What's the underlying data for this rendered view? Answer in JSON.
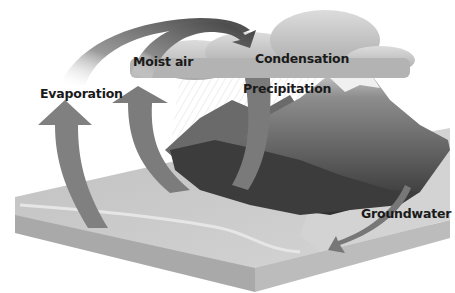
{
  "diagram": {
    "style": "grayscale",
    "colors": {
      "arrow": "#7f7f7f",
      "arrow_dark": "#4e4e4e",
      "cloud": "#bdbdbd",
      "mountain_dark": "#3a3a3a",
      "ground": "#c9c9c9",
      "block_side": "#a8a8a8",
      "text": "#1a1a1a"
    },
    "labels": {
      "evaporation": "Evaporation",
      "moist_air": "Moist air",
      "condensation": "Condensation",
      "precipitation": "Precipitation",
      "groundwater": "Groundwater"
    },
    "elements": [
      {
        "name": "evaporation-arrow",
        "direction": "up"
      },
      {
        "name": "moist-air-arrow",
        "direction": "up"
      },
      {
        "name": "moist-air-to-cloud-arc",
        "direction": "right"
      },
      {
        "name": "precipitation-arrow",
        "direction": "down"
      },
      {
        "name": "groundwater-arrow",
        "direction": "down-left"
      }
    ]
  }
}
